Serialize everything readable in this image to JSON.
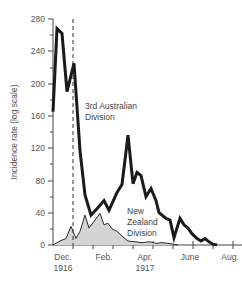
{
  "chart_data": {
    "type": "line",
    "title": "",
    "xlabel": "",
    "ylabel": "Incidence rate (log scale)",
    "ylim": [
      0,
      280
    ],
    "yticks": [
      0,
      40,
      80,
      120,
      160,
      200,
      240,
      280
    ],
    "xtick_labels": [
      {
        "label": "Dec.",
        "sub": "1916"
      },
      {
        "label": "Feb.",
        "sub": ""
      },
      {
        "label": "Apr.",
        "sub": "1917"
      },
      {
        "label": "June",
        "sub": ""
      },
      {
        "label": "Aug.",
        "sub": ""
      }
    ],
    "x_range": [
      "Nov. 1916",
      "Aug. 1917"
    ],
    "reference_line": {
      "style": "dashed",
      "position": "Dec. 1916"
    },
    "series": [
      {
        "name": "3rd Australian Division",
        "style": "thick black line",
        "points": [
          [
            53,
            165
          ],
          [
            57,
            268
          ],
          [
            62,
            262
          ],
          [
            67,
            190
          ],
          [
            74,
            225
          ],
          [
            80,
            117
          ],
          [
            85,
            62
          ],
          [
            91,
            37
          ],
          [
            97,
            45
          ],
          [
            104,
            55
          ],
          [
            109,
            43
          ],
          [
            117,
            65
          ],
          [
            122,
            75
          ],
          [
            128,
            136
          ],
          [
            133,
            76
          ],
          [
            137,
            90
          ],
          [
            141,
            86
          ],
          [
            146,
            60
          ],
          [
            151,
            70
          ],
          [
            156,
            55
          ],
          [
            159,
            40
          ],
          [
            166,
            33
          ],
          [
            170,
            31
          ],
          [
            174,
            9
          ],
          [
            180,
            33
          ],
          [
            184,
            25
          ],
          [
            188,
            21
          ],
          [
            192,
            14
          ],
          [
            197,
            8
          ],
          [
            201,
            5
          ],
          [
            205,
            8
          ],
          [
            209,
            4
          ],
          [
            213,
            1
          ],
          [
            217,
            0
          ]
        ]
      },
      {
        "name": "New Zealand Division",
        "style": "thin black line, grey filled area",
        "points": [
          [
            53,
            0
          ],
          [
            60,
            5
          ],
          [
            66,
            8
          ],
          [
            71,
            23
          ],
          [
            76,
            8
          ],
          [
            80,
            17
          ],
          [
            85,
            37
          ],
          [
            89,
            21
          ],
          [
            95,
            31
          ],
          [
            100,
            39
          ],
          [
            104,
            25
          ],
          [
            108,
            27
          ],
          [
            112,
            20
          ],
          [
            117,
            17
          ],
          [
            122,
            11
          ],
          [
            128,
            5
          ],
          [
            135,
            4
          ],
          [
            142,
            3
          ],
          [
            150,
            4
          ],
          [
            156,
            2
          ],
          [
            162,
            3
          ],
          [
            168,
            2
          ],
          [
            174,
            1
          ],
          [
            178,
            0
          ]
        ]
      }
    ],
    "annotations": [
      {
        "text": "3rd Australian",
        "line2": "Division"
      },
      {
        "text": "New",
        "line2": "Zealand",
        "line3": "Division"
      }
    ]
  },
  "labels": {
    "ylabel": "Incidence rate (log scale)",
    "aus_line1": "3rd Australian",
    "aus_line2": "Division",
    "nz_line1": "New",
    "nz_line2": "Zealand",
    "nz_line3": "Division",
    "yt0": "0",
    "yt40": "40",
    "yt80": "80",
    "yt120": "120",
    "yt160": "160",
    "yt200": "200",
    "yt240": "240",
    "yt280": "280",
    "x_dec": "Dec.",
    "x_1916": "1916",
    "x_feb": "Feb.",
    "x_apr": "Apr.",
    "x_1917": "1917",
    "x_june": "June",
    "x_aug": "Aug."
  },
  "colors": {
    "aus_line": "#1a1a1a",
    "nz_line": "#2a2a2a",
    "nz_fill": "#d4d4d4",
    "axis": "#444444",
    "text": "#555555"
  }
}
